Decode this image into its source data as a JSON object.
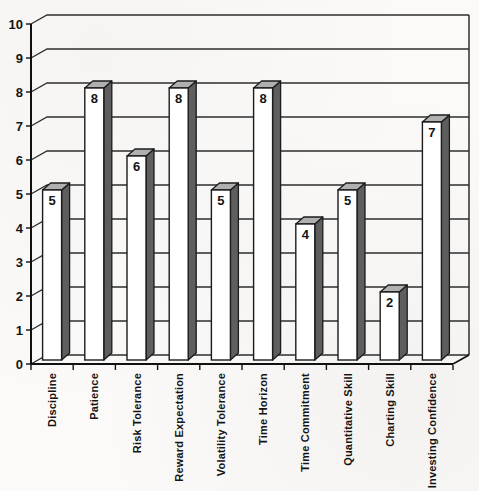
{
  "chart_data": {
    "type": "bar",
    "style": "3d-column",
    "categories": [
      "Discipline",
      "Patience",
      "Risk Tolerance",
      "Reward Expectation",
      "Volatility Tolerance",
      "Time Horizon",
      "Time Commitment",
      "Quantitative Skill",
      "Charting Skill",
      "Investing Confidence"
    ],
    "values": [
      5,
      8,
      6,
      8,
      5,
      8,
      4,
      5,
      2,
      7
    ],
    "data_labels": [
      5,
      8,
      6,
      8,
      5,
      8,
      4,
      5,
      2,
      7
    ],
    "show_data_labels": true,
    "xlabel": "",
    "ylabel": "",
    "ylim": [
      0,
      10
    ],
    "yticks": [
      0,
      1,
      2,
      3,
      4,
      5,
      6,
      7,
      8,
      9,
      10
    ],
    "grid": true,
    "legend": false,
    "colors": {
      "bar_front": "#ffffff",
      "bar_side": "#5e5e5e",
      "bar_top": "#b0b0b0",
      "outline": "#1c1c1c",
      "grid_line": "#2e2e2e",
      "axis_line": "#111111",
      "text": "#141414",
      "background": "#fbfaf8"
    }
  }
}
